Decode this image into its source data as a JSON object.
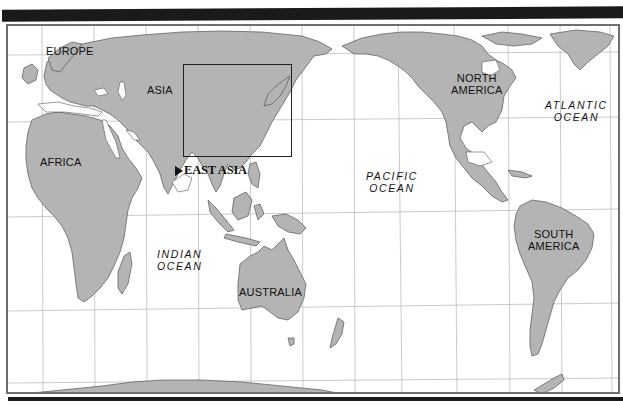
{
  "map": {
    "projection": "Pacific-centered world map",
    "colors": {
      "land": "#b4b4b4",
      "coast": "#555555",
      "water": "#ffffff",
      "grid": "#bdbdbd",
      "bar": "#1a1a1a",
      "frame": "#6e6e6e"
    },
    "continents": [
      {
        "id": "europe",
        "label": "EUROPE"
      },
      {
        "id": "asia",
        "label": "ASIA"
      },
      {
        "id": "africa",
        "label": "AFRICA"
      },
      {
        "id": "australia",
        "label": "AUSTRALIA"
      },
      {
        "id": "north-america",
        "label": "NORTH AMERICA",
        "lines": [
          "NORTH",
          "AMERICA"
        ]
      },
      {
        "id": "south-america",
        "label": "SOUTH AMERICA",
        "lines": [
          "SOUTH",
          "AMERICA"
        ]
      }
    ],
    "oceans": [
      {
        "id": "pacific",
        "lines": [
          "PACIFIC",
          "OCEAN"
        ]
      },
      {
        "id": "atlantic",
        "lines": [
          "ATLANTIC",
          "OCEAN"
        ]
      },
      {
        "id": "indian",
        "lines": [
          "INDIAN",
          "OCEAN"
        ]
      }
    ],
    "highlight": {
      "label": "EAST ASIA",
      "pointer": "triangle-right"
    }
  }
}
